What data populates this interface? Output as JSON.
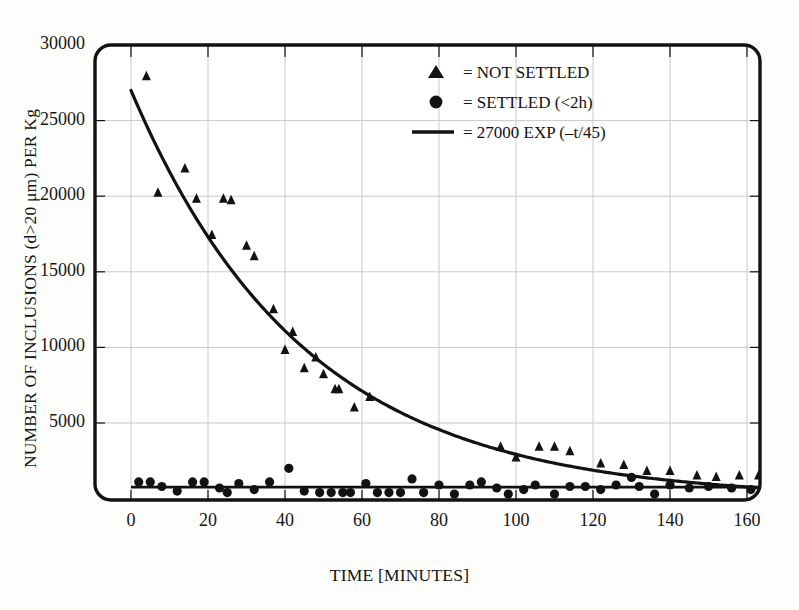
{
  "figure": {
    "background_color": "#fdfdfb",
    "ink_color": "#121212",
    "grid_color": "#c9c9c9"
  },
  "axes": {
    "x_label": "TIME [MINUTES]",
    "y_label": "NUMBER OF INCLUSIONS (d>20 μm) PER Kg",
    "x_ticks": [
      "0",
      "20",
      "40",
      "60",
      "80",
      "100",
      "120",
      "140",
      "160"
    ],
    "y_ticks": [
      "5000",
      "10000",
      "15000",
      "20000",
      "25000",
      "30000"
    ]
  },
  "legend": {
    "items": [
      {
        "marker": "triangle",
        "glyph": "▲",
        "label": "= NOT SETTLED"
      },
      {
        "marker": "circle",
        "glyph": "●",
        "label": "= SETTLED (<2h)"
      },
      {
        "marker": "line",
        "glyph": "—",
        "label": "= 27000 EXP (–t/45)"
      }
    ]
  },
  "chart_data": {
    "type": "scatter",
    "title": "",
    "xlabel": "TIME [MINUTES]",
    "ylabel": "NUMBER OF INCLUSIONS (d>20 μm) PER Kg",
    "xlim": [
      0,
      164
    ],
    "ylim": [
      0,
      30000
    ],
    "xticks": [
      0,
      20,
      40,
      60,
      80,
      100,
      120,
      140,
      160
    ],
    "yticks": [
      5000,
      10000,
      15000,
      20000,
      25000,
      30000
    ],
    "grid": true,
    "legend_position": "upper-right-inside",
    "fit": {
      "name": "27000 EXP (–t/45)",
      "type": "exponential",
      "amplitude": 27000,
      "decay_constant": 45,
      "formula": "y = 27000 * exp(-t/45)",
      "style": "solid-line"
    },
    "series": [
      {
        "name": "NOT SETTLED",
        "marker": "triangle",
        "points": [
          [
            4,
            27900
          ],
          [
            7,
            20200
          ],
          [
            14,
            21800
          ],
          [
            17,
            19800
          ],
          [
            21,
            17400
          ],
          [
            24,
            19800
          ],
          [
            26,
            19700
          ],
          [
            30,
            16700
          ],
          [
            32,
            16000
          ],
          [
            37,
            12500
          ],
          [
            40,
            9800
          ],
          [
            42,
            11000
          ],
          [
            45,
            8600
          ],
          [
            48,
            9300
          ],
          [
            50,
            8200
          ],
          [
            53,
            7200
          ],
          [
            54,
            7200
          ],
          [
            58,
            6000
          ],
          [
            62,
            6700
          ],
          [
            96,
            3400
          ],
          [
            100,
            2700
          ],
          [
            106,
            3400
          ],
          [
            110,
            3400
          ],
          [
            114,
            3100
          ],
          [
            122,
            2300
          ],
          [
            128,
            2200
          ],
          [
            134,
            1800
          ],
          [
            140,
            1800
          ],
          [
            147,
            1500
          ],
          [
            152,
            1400
          ],
          [
            158,
            1500
          ],
          [
            163,
            1500
          ]
        ]
      },
      {
        "name": "SETTLED (<2h)",
        "marker": "circle",
        "points": [
          [
            2,
            1100
          ],
          [
            5,
            1100
          ],
          [
            8,
            800
          ],
          [
            12,
            500
          ],
          [
            16,
            1100
          ],
          [
            19,
            1100
          ],
          [
            23,
            700
          ],
          [
            25,
            400
          ],
          [
            28,
            1000
          ],
          [
            32,
            600
          ],
          [
            36,
            1100
          ],
          [
            41,
            2000
          ],
          [
            45,
            500
          ],
          [
            49,
            400
          ],
          [
            52,
            400
          ],
          [
            55,
            400
          ],
          [
            57,
            400
          ],
          [
            61,
            1000
          ],
          [
            64,
            400
          ],
          [
            67,
            400
          ],
          [
            70,
            400
          ],
          [
            73,
            1300
          ],
          [
            76,
            400
          ],
          [
            80,
            900
          ],
          [
            84,
            300
          ],
          [
            88,
            900
          ],
          [
            91,
            1100
          ],
          [
            95,
            700
          ],
          [
            98,
            300
          ],
          [
            102,
            600
          ],
          [
            105,
            900
          ],
          [
            110,
            300
          ],
          [
            114,
            800
          ],
          [
            118,
            800
          ],
          [
            122,
            600
          ],
          [
            126,
            900
          ],
          [
            130,
            1400
          ],
          [
            132,
            800
          ],
          [
            136,
            300
          ],
          [
            140,
            900
          ],
          [
            145,
            700
          ],
          [
            150,
            800
          ],
          [
            156,
            700
          ],
          [
            161,
            600
          ]
        ]
      }
    ]
  }
}
